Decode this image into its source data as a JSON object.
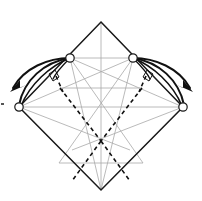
{
  "figure": {
    "caption": "",
    "colors": {
      "outline": "#1a1a1a",
      "crease": "#a8a8a8",
      "fold_dashed": "#111111",
      "arrow": "#111111",
      "marker_fill": "#ffffff",
      "background": "#ffffff"
    },
    "canvas": {
      "width": 202,
      "height": 201
    },
    "vertices": {
      "top": {
        "x": 101,
        "y": 22
      },
      "left": {
        "x": 19,
        "y": 107
      },
      "right": {
        "x": 183,
        "y": 107
      },
      "bottom": {
        "x": 101,
        "y": 190
      },
      "upper_left_marker": {
        "x": 70,
        "y": 58
      },
      "upper_right_marker": {
        "x": 133,
        "y": 58
      },
      "center": {
        "x": 101,
        "y": 107
      }
    },
    "markers": [
      {
        "name": "circle-marker-upper-left",
        "cx": 70,
        "cy": 58,
        "r": 4.2
      },
      {
        "name": "circle-marker-upper-right",
        "cx": 133,
        "cy": 58,
        "r": 4.2
      },
      {
        "name": "circle-marker-left",
        "cx": 19,
        "cy": 107,
        "r": 4.2
      },
      {
        "name": "circle-marker-right",
        "cx": 183,
        "cy": 107,
        "r": 4.2
      }
    ],
    "arrows": [
      {
        "name": "fold-arrow-left-outer",
        "from": "upper-left-marker",
        "to": "left-outward",
        "direction": "down-left"
      },
      {
        "name": "fold-arrow-left-inner",
        "from": "upper-left-marker",
        "to": "left-vertex",
        "direction": "down-left"
      },
      {
        "name": "fold-arrow-right-outer",
        "from": "upper-right-marker",
        "to": "right-outward",
        "direction": "down-right"
      },
      {
        "name": "fold-arrow-right-inner",
        "from": "upper-right-marker",
        "to": "right-vertex",
        "direction": "down-right"
      }
    ],
    "right_angle_marks": [
      {
        "name": "right-angle-mark-left",
        "x": 52,
        "y": 78
      },
      {
        "name": "right-angle-mark-right",
        "x": 150,
        "y": 78
      }
    ],
    "fold_lines": {
      "type": "valley",
      "style": "dashed",
      "count": 4
    },
    "legend": {
      "outline_label": "paper edge",
      "crease_label": "existing crease",
      "dashed_label": "valley fold",
      "arrow_label": "fold direction"
    }
  }
}
